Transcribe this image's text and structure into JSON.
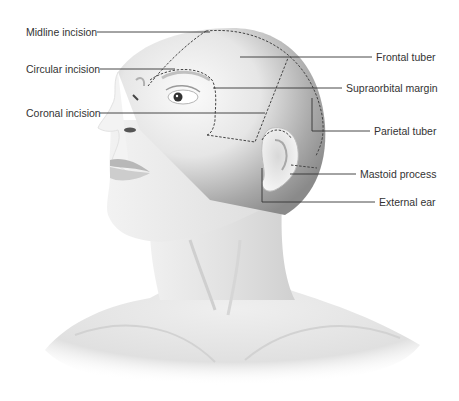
{
  "figure": {
    "colors": {
      "background": "#ffffff",
      "text": "#333333",
      "leader_line": "#333333",
      "incision_line": "#444444",
      "skin_light": "#f4f4f4",
      "skin_mid": "#d6d6d6",
      "skin_dark": "#9a9a9a"
    },
    "labels_left": [
      {
        "id": "midline-incision",
        "text": "Midline incision"
      },
      {
        "id": "circular-incision",
        "text": "Circular incision"
      },
      {
        "id": "coronal-incision",
        "text": "Coronal incision"
      }
    ],
    "labels_right": [
      {
        "id": "frontal-tuber",
        "text": "Frontal tuber"
      },
      {
        "id": "supraorbital-margin",
        "text": "Supraorbital margin"
      },
      {
        "id": "parietal-tuber",
        "text": "Parietal tuber"
      },
      {
        "id": "mastoid-process",
        "text": "Mastoid process"
      },
      {
        "id": "external-ear",
        "text": "External ear"
      }
    ]
  }
}
